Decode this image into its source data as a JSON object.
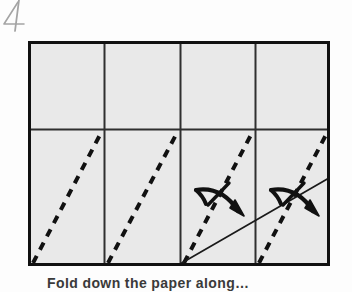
{
  "page": {
    "background_color": "#fdfdfd",
    "width": 352,
    "height": 292
  },
  "corner_mark": {
    "label": "4",
    "description": "handwritten-page-number",
    "color": "#7a7a7a"
  },
  "figure": {
    "frame": {
      "x": 28,
      "y": 41,
      "width": 302,
      "height": 225,
      "fill_color": "#e8e8e8",
      "stroke_color": "#1a1a1a",
      "stroke_width": 3
    },
    "grid": {
      "columns": 4,
      "rows": 2,
      "vertical_dividers_x": [
        104,
        180,
        255
      ],
      "horizontal_dividers_y": [
        129
      ],
      "divider_color": "#2a2a2a",
      "divider_width": 2
    },
    "fold_lines": {
      "style": "dashed",
      "color": "#111111",
      "width": 4,
      "dash_pattern": "8 7",
      "note": "valley fold creases, bottom-left to top-right of each lower cell",
      "segments": [
        {
          "x1": 33,
          "y1": 263,
          "x2": 102,
          "y2": 131
        },
        {
          "x1": 108,
          "y1": 263,
          "x2": 178,
          "y2": 131
        },
        {
          "x1": 184,
          "y1": 263,
          "x2": 253,
          "y2": 131
        },
        {
          "x1": 259,
          "y1": 263,
          "x2": 328,
          "y2": 131
        }
      ]
    },
    "reference_line": {
      "style": "solid",
      "color": "#1a1a1a",
      "width": 1.6,
      "note": "thin solid edge line spanning cells three and four",
      "x1": 180,
      "y1": 264,
      "x2": 329,
      "y2": 178
    },
    "arrows": [
      {
        "name": "fold-and-unfold-arrow-left",
        "cell": 3,
        "color": "#111111",
        "tip_x": 243,
        "tip_y": 215,
        "description": "curved arrow with crossing tick indicating fold then unfold"
      },
      {
        "name": "fold-and-unfold-arrow-right",
        "cell": 4,
        "color": "#111111",
        "tip_x": 318,
        "tip_y": 215,
        "description": "curved arrow with crossing tick indicating fold then unfold"
      }
    ]
  },
  "caption": {
    "text": "Fold down the paper along…",
    "visible_portion": "top edge of letters only, clipped by page crop"
  }
}
